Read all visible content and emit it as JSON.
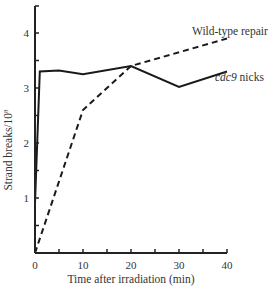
{
  "chart_data": {
    "type": "line",
    "title": "",
    "xlabel": "Time after irradiation (min)",
    "ylabel": "Strand breaks/10⁸",
    "xlim": [
      0,
      40
    ],
    "ylim": [
      0,
      4.5
    ],
    "x_ticks": [
      0,
      10,
      20,
      30,
      40
    ],
    "y_ticks": [
      1,
      2,
      3,
      4
    ],
    "grid": false,
    "legend": "inline labels at line ends",
    "series": [
      {
        "name": "Wild-type repair",
        "style": "dashed",
        "x": [
          0,
          10,
          20,
          40
        ],
        "y": [
          0.0,
          2.6,
          3.4,
          3.9
        ]
      },
      {
        "name": "cdc9 nicks",
        "style": "solid",
        "x": [
          0,
          1,
          5,
          10,
          20,
          30,
          40
        ],
        "y": [
          0.9,
          3.3,
          3.32,
          3.25,
          3.4,
          3.02,
          3.3
        ]
      }
    ]
  },
  "labels": {
    "wild_type": "Wild-type repair",
    "cdc9_italic": "cdc9",
    "cdc9_rest": " nicks",
    "xlabel": "Time after irradiation (min)",
    "ylabel": "Strand breaks/10",
    "ylabel_sup": "8",
    "x_tick_labels": [
      "0",
      "10",
      "20",
      "30",
      "40"
    ],
    "y_tick_labels": [
      "1",
      "2",
      "3",
      "4"
    ]
  }
}
